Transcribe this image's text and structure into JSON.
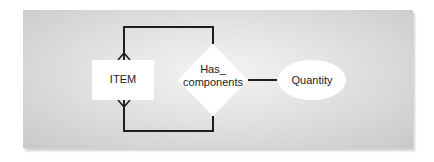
{
  "diagram": {
    "type": "entity-relationship",
    "entities": [
      {
        "id": "item",
        "label": "ITEM",
        "shape": "rectangle"
      }
    ],
    "relationships": [
      {
        "id": "has_components",
        "label_line1": "Has_",
        "label_line2": "components",
        "shape": "diamond"
      }
    ],
    "attributes": [
      {
        "id": "quantity",
        "label": "Quantity",
        "shape": "ellipse",
        "attached_to": "has_components"
      }
    ],
    "connections": [
      {
        "from": "item",
        "to": "has_components",
        "route": "top-loop",
        "cardinality": "many"
      },
      {
        "from": "item",
        "to": "has_components",
        "route": "bottom-loop",
        "cardinality": "many"
      },
      {
        "from": "has_components",
        "to": "quantity",
        "route": "straight"
      }
    ],
    "colors": {
      "line": "#1e1e1e",
      "shape_fill": "#ffffff",
      "panel_light": "#f4f4f4",
      "panel_dark": "#c9c9c9"
    }
  }
}
